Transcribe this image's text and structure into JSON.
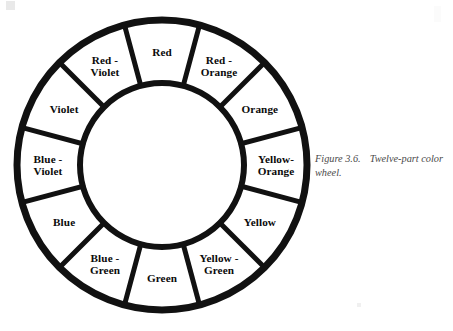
{
  "figure": {
    "type": "twelve-part color wheel",
    "caption_number": "Figure 3.6.",
    "caption_text": "Twelve-part color wheel.",
    "background_color": "#ffffff",
    "stroke_color": "#111111",
    "text_color": "#0b0b0b",
    "caption_color": "#4a4a4a"
  },
  "wheel": {
    "segment_count": 12,
    "center_x": 148,
    "center_y": 150,
    "outer_radius": 145,
    "inner_radius": 82,
    "label_radius": 114,
    "outer_stroke_width": 7,
    "inner_stroke_width": 6,
    "divider_stroke_width": 5,
    "start_angle_deg": -105,
    "segment_span_deg": 30,
    "segments": [
      {
        "name": "red",
        "lines": [
          "Red"
        ],
        "angle_deg": -90,
        "label_radius": 113
      },
      {
        "name": "red-orange",
        "lines": [
          "Red -",
          "Orange"
        ],
        "angle_deg": -60,
        "label_radius": 114
      },
      {
        "name": "orange",
        "lines": [
          "Orange"
        ],
        "angle_deg": -30,
        "label_radius": 113
      },
      {
        "name": "yellow-orange",
        "lines": [
          "Yellow-",
          "Orange"
        ],
        "angle_deg": 0,
        "label_radius": 114
      },
      {
        "name": "yellow",
        "lines": [
          "Yellow"
        ],
        "angle_deg": 30,
        "label_radius": 113
      },
      {
        "name": "yellow-green",
        "lines": [
          "Yellow -",
          "Green"
        ],
        "angle_deg": 60,
        "label_radius": 114
      },
      {
        "name": "green",
        "lines": [
          "Green"
        ],
        "angle_deg": 90,
        "label_radius": 113
      },
      {
        "name": "blue-green",
        "lines": [
          "Blue -",
          "Green"
        ],
        "angle_deg": 120,
        "label_radius": 114
      },
      {
        "name": "blue",
        "lines": [
          "Blue"
        ],
        "angle_deg": 150,
        "label_radius": 113
      },
      {
        "name": "blue-violet",
        "lines": [
          "Blue -",
          "Violet"
        ],
        "angle_deg": 180,
        "label_radius": 114
      },
      {
        "name": "violet",
        "lines": [
          "Violet"
        ],
        "angle_deg": 210,
        "label_radius": 113
      },
      {
        "name": "red-violet",
        "lines": [
          "Red -",
          "Violet"
        ],
        "angle_deg": 240,
        "label_radius": 114
      }
    ]
  }
}
